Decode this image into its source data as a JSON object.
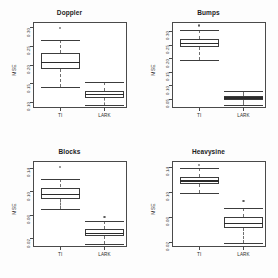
{
  "figure": {
    "layout": "2x2",
    "background": "#fdfdfd",
    "panel_border_color": "#4a4a4a",
    "box_color": "#3c3c3c",
    "median_color": "#2b2b2b",
    "whisker_color": "#6f6f6f"
  },
  "chart_data": [
    {
      "type": "box",
      "title": "Doppler",
      "xlabel": "",
      "ylabel": "MSE",
      "categories": [
        "TI",
        "LARK"
      ],
      "ylim": [
        0.085,
        0.315
      ],
      "yticks": [
        0.1,
        0.15,
        0.2,
        0.25,
        0.3
      ],
      "ytick_labels": [
        "0.10",
        "0.15",
        "0.20",
        "0.25",
        "0.30"
      ],
      "grid": false,
      "legend": "none",
      "boxes": [
        {
          "name": "TI",
          "lower_whisker": 0.142,
          "q1": 0.188,
          "median": 0.206,
          "q3": 0.233,
          "upper_whisker": 0.268,
          "outliers": [
            0.298
          ]
        },
        {
          "name": "LARK",
          "lower_whisker": 0.094,
          "q1": 0.112,
          "median": 0.122,
          "q3": 0.131,
          "upper_whisker": 0.155,
          "outliers": []
        }
      ]
    },
    {
      "type": "box",
      "title": "Bumps",
      "xlabel": "",
      "ylabel": "MSE",
      "categories": [
        "TI",
        "LARK"
      ],
      "ylim": [
        0.018,
        0.335
      ],
      "yticks": [
        0.05,
        0.1,
        0.15,
        0.2,
        0.25,
        0.3
      ],
      "ytick_labels": [
        "0.05",
        "0.10",
        "0.15",
        "0.20",
        "0.25",
        "0.30"
      ],
      "grid": false,
      "legend": "none",
      "boxes": [
        {
          "name": "TI",
          "lower_whisker": 0.196,
          "q1": 0.243,
          "median": 0.255,
          "q3": 0.272,
          "upper_whisker": 0.305,
          "outliers": [
            0.322
          ]
        },
        {
          "name": "LARK",
          "lower_whisker": 0.029,
          "q1": 0.048,
          "median": 0.055,
          "q3": 0.062,
          "upper_whisker": 0.08,
          "outliers": []
        }
      ]
    },
    {
      "type": "box",
      "title": "Blocks",
      "xlabel": "",
      "ylabel": "MSE",
      "categories": [
        "TI",
        "LARK"
      ],
      "ylim": [
        0.006,
        0.152
      ],
      "yticks": [
        0.02,
        0.06,
        0.1,
        0.14
      ],
      "ytick_labels": [
        "0.02",
        "0.06",
        "0.10",
        "0.14"
      ],
      "grid": false,
      "legend": "none",
      "boxes": [
        {
          "name": "TI",
          "lower_whisker": 0.07,
          "q1": 0.088,
          "median": 0.095,
          "q3": 0.107,
          "upper_whisker": 0.121,
          "outliers": [
            0.142
          ]
        },
        {
          "name": "LARK",
          "lower_whisker": 0.011,
          "q1": 0.025,
          "median": 0.029,
          "q3": 0.036,
          "upper_whisker": 0.05,
          "outliers": [
            0.057
          ]
        }
      ]
    },
    {
      "type": "box",
      "title": "Heavysine",
      "xlabel": "",
      "ylabel": "MSE",
      "categories": [
        "TI",
        "LARK"
      ],
      "ylim": [
        0.012,
        0.15
      ],
      "yticks": [
        0.02,
        0.06,
        0.1,
        0.14
      ],
      "ytick_labels": [
        "0.02",
        "0.06",
        "0.10",
        "0.14"
      ],
      "grid": false,
      "legend": "none",
      "boxes": [
        {
          "name": "TI",
          "lower_whisker": 0.098,
          "q1": 0.113,
          "median": 0.118,
          "q3": 0.125,
          "upper_whisker": 0.139,
          "outliers": [
            0.144
          ]
        },
        {
          "name": "LARK",
          "lower_whisker": 0.019,
          "q1": 0.043,
          "median": 0.05,
          "q3": 0.06,
          "upper_whisker": 0.075,
          "outliers": [
            0.086
          ]
        }
      ]
    }
  ]
}
